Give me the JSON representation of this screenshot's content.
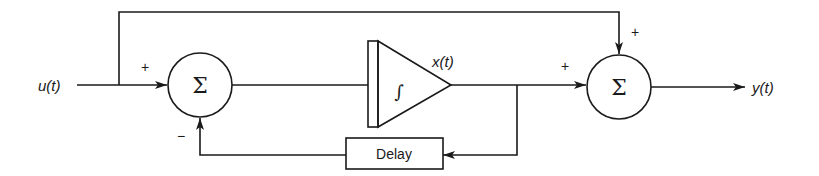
{
  "diagram": {
    "type": "block-diagram",
    "signals": {
      "input": "u(t)",
      "state": "x(t)",
      "output": "y(t)"
    },
    "blocks": {
      "sum1": {
        "symbol": "Σ",
        "inputs": [
          {
            "sign": "+",
            "from": "u(t)"
          },
          {
            "sign": "−",
            "from": "Delay"
          }
        ]
      },
      "integrator": {
        "symbol": "∫"
      },
      "delay": {
        "label": "Delay"
      },
      "sum2": {
        "symbol": "Σ",
        "inputs": [
          {
            "sign": "+",
            "from": "x(t)"
          },
          {
            "sign": "+",
            "from": "u(t) feedforward"
          }
        ]
      }
    },
    "signs": {
      "sum1_input_plus": "+",
      "sum1_feedback_minus": "−",
      "sum2_main_plus": "+",
      "sum2_top_plus": "+"
    },
    "colors": {
      "stroke": "#1a1a1a",
      "background": "#ffffff"
    }
  }
}
